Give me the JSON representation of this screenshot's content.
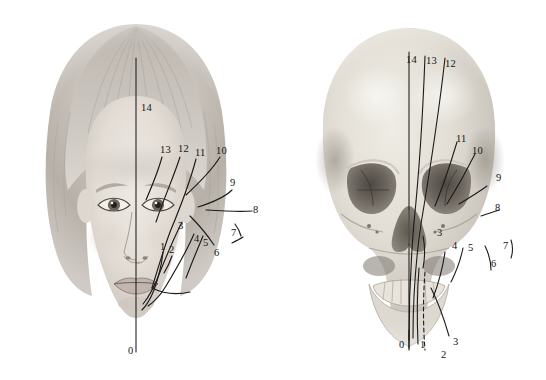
{
  "figure": {
    "background_color": "#ffffff",
    "line_color": "#1b1b1b",
    "label_color": "#141414",
    "width": 546,
    "height": 380
  },
  "panels": [
    {
      "id": "face",
      "name": "child-face-photograph",
      "midline_label": "14",
      "baseline_label": "0",
      "labels": [
        {
          "text": "14",
          "x": 141,
          "y": 103
        },
        {
          "text": "13",
          "x": 160,
          "y": 145
        },
        {
          "text": "12",
          "x": 178,
          "y": 144
        },
        {
          "text": "11",
          "x": 195,
          "y": 148
        },
        {
          "text": "10",
          "x": 216,
          "y": 146
        },
        {
          "text": "9",
          "x": 230,
          "y": 178
        },
        {
          "text": "8",
          "x": 253,
          "y": 207
        },
        {
          "text": "7",
          "x": 231,
          "y": 228
        },
        {
          "text": "6",
          "x": 214,
          "y": 248
        },
        {
          "text": "5",
          "x": 203,
          "y": 240
        },
        {
          "text": "4",
          "x": 194,
          "y": 238
        },
        {
          "text": "3",
          "x": 179,
          "y": 224
        },
        {
          "text": "2",
          "x": 170,
          "y": 247
        },
        {
          "text": "1",
          "x": 161,
          "y": 244
        },
        {
          "text": "0",
          "x": 143,
          "y": 348
        }
      ]
    },
    {
      "id": "skull",
      "name": "human-skull-photograph",
      "midline_label": "14",
      "baseline_label": "0",
      "labels": [
        {
          "text": "14",
          "x": 406,
          "y": 57
        },
        {
          "text": "13",
          "x": 426,
          "y": 58
        },
        {
          "text": "12",
          "x": 445,
          "y": 61
        },
        {
          "text": "11",
          "x": 456,
          "y": 136
        },
        {
          "text": "10",
          "x": 472,
          "y": 148
        },
        {
          "text": "9",
          "x": 496,
          "y": 175
        },
        {
          "text": "8",
          "x": 495,
          "y": 205
        },
        {
          "text": "7",
          "x": 503,
          "y": 243
        },
        {
          "text": "6",
          "x": 491,
          "y": 261
        },
        {
          "text": "5",
          "x": 468,
          "y": 245
        },
        {
          "text": "4",
          "x": 452,
          "y": 243
        },
        {
          "text": "3",
          "x": 437,
          "y": 230
        },
        {
          "text": "3",
          "x": 453,
          "y": 339
        },
        {
          "text": "2",
          "x": 441,
          "y": 352
        },
        {
          "text": "1",
          "x": 420,
          "y": 342
        },
        {
          "text": "0",
          "x": 408,
          "y": 342
        }
      ]
    }
  ],
  "legend": {
    "landmark_numbers": [
      "0",
      "1",
      "2",
      "3",
      "4",
      "5",
      "6",
      "7",
      "8",
      "9",
      "10",
      "11",
      "12",
      "13",
      "14"
    ],
    "description": "Numbered leader lines marking corresponding soft-tissue and skeletal landmarks"
  }
}
